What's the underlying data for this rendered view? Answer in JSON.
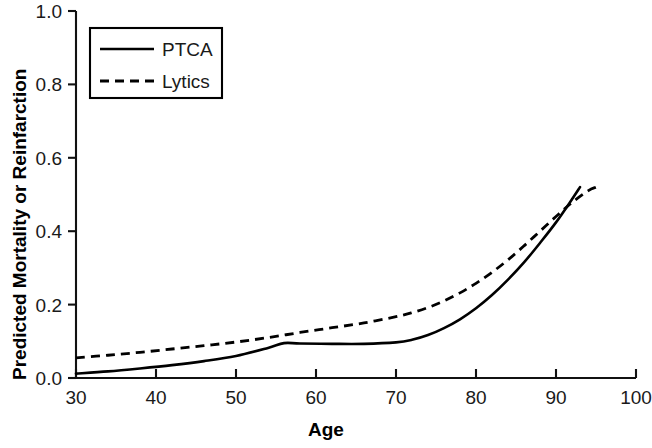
{
  "chart_data": {
    "type": "line",
    "title": "",
    "xlabel": "Age",
    "ylabel": "Predicted Mortality or Reinfarction",
    "xlim": [
      30,
      100
    ],
    "ylim": [
      0.0,
      1.0
    ],
    "grid": false,
    "legend_position": "top-left",
    "xticks": [
      30,
      40,
      50,
      60,
      70,
      80,
      90,
      100
    ],
    "xtick_labels": [
      "30",
      "40",
      "50",
      "60",
      "70",
      "80",
      "90",
      "100"
    ],
    "yticks": [
      0.0,
      0.2,
      0.4,
      0.6,
      0.8,
      1.0
    ],
    "ytick_labels": [
      "0.0",
      "0.2",
      "0.4",
      "0.6",
      "0.8",
      "1.0"
    ],
    "series": [
      {
        "name": "PTCA",
        "style": "solid",
        "color": "#000000",
        "x": [
          30,
          34,
          38,
          42,
          46,
          50,
          54,
          56,
          58,
          62,
          66,
          70,
          72,
          74,
          76,
          78,
          80,
          82,
          84,
          86,
          88,
          90,
          92,
          93
        ],
        "values": [
          0.012,
          0.018,
          0.026,
          0.035,
          0.046,
          0.06,
          0.082,
          0.095,
          0.094,
          0.093,
          0.093,
          0.097,
          0.104,
          0.117,
          0.136,
          0.16,
          0.19,
          0.226,
          0.268,
          0.315,
          0.368,
          0.424,
          0.487,
          0.52
        ]
      },
      {
        "name": "Lytics",
        "style": "dashed",
        "color": "#000000",
        "x": [
          30,
          34,
          38,
          42,
          46,
          50,
          54,
          58,
          62,
          66,
          70,
          72,
          74,
          76,
          78,
          80,
          82,
          84,
          86,
          88,
          90,
          92,
          94,
          95
        ],
        "values": [
          0.055,
          0.062,
          0.07,
          0.079,
          0.088,
          0.098,
          0.11,
          0.124,
          0.137,
          0.15,
          0.167,
          0.178,
          0.192,
          0.21,
          0.232,
          0.258,
          0.288,
          0.322,
          0.36,
          0.4,
          0.44,
          0.478,
          0.51,
          0.52
        ]
      }
    ]
  },
  "legend": {
    "entries": [
      {
        "label": "PTCA",
        "style": "solid"
      },
      {
        "label": "Lytics",
        "style": "dashed"
      }
    ]
  }
}
